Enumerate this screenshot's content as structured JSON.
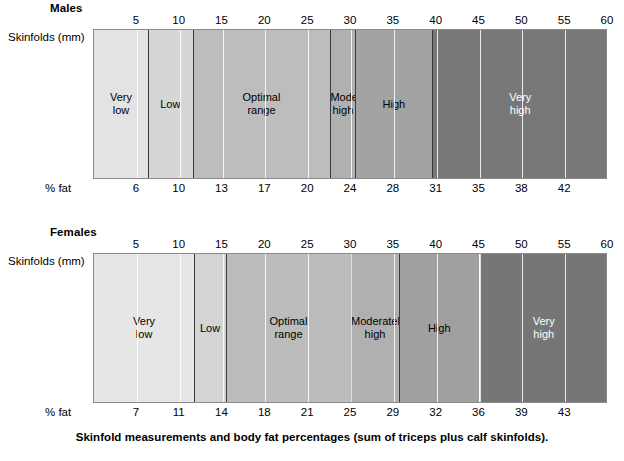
{
  "caption": "Skinfold measurements and body fat percentages (sum of triceps plus calf skinfolds).",
  "axis_labels": {
    "skinfolds": "Skinfolds (mm)",
    "pct_fat": "% fat"
  },
  "chart_data": {
    "type": "bar",
    "title": "Skinfold measurements and body fat percentages (sum of triceps plus calf skinfolds).",
    "xlabel": "Skinfolds (mm)",
    "ylabel": "% fat",
    "xlim": [
      0,
      60
    ],
    "grid": true,
    "legend": "none",
    "charts": [
      {
        "name": "Males",
        "top_axis_ticks": [
          5,
          10,
          15,
          20,
          25,
          30,
          35,
          40,
          45,
          50,
          55,
          60
        ],
        "bottom_axis_ticks": [
          6,
          10,
          13,
          17,
          20,
          24,
          28,
          31,
          35,
          38,
          42
        ],
        "bottom_tick_positions_mm": [
          5,
          10,
          15,
          20,
          25,
          30,
          35,
          40,
          45,
          50,
          55
        ],
        "bands": [
          {
            "label": "Very\nlow",
            "start_mm": 0,
            "end_mm": 6.3,
            "color": "#e3e3e3",
            "text_color": "#000000"
          },
          {
            "label": "Low",
            "start_mm": 6.3,
            "end_mm": 11.5,
            "color": "#d6d6d6",
            "text_color": "#000000"
          },
          {
            "label": "Optimal\nrange",
            "start_mm": 11.5,
            "end_mm": 27.6,
            "color": "#bdbdbd",
            "text_color": "#000000"
          },
          {
            "label": "Moderately\nhigh",
            "start_mm": 27.6,
            "end_mm": 30.5,
            "color": "#b0b0b0",
            "text_color": "#000000"
          },
          {
            "label": "High",
            "start_mm": 30.5,
            "end_mm": 39.5,
            "color": "#a3a3a3",
            "text_color": "#000000"
          },
          {
            "label": "Very\nhigh",
            "start_mm": 39.5,
            "end_mm": 60,
            "color": "#787878",
            "text_color": "#ffffff"
          }
        ]
      },
      {
        "name": "Females",
        "top_axis_ticks": [
          5,
          10,
          15,
          20,
          25,
          30,
          35,
          40,
          45,
          50,
          55,
          60
        ],
        "bottom_axis_ticks": [
          7,
          11,
          14,
          18,
          21,
          25,
          29,
          32,
          36,
          39,
          43
        ],
        "bottom_tick_positions_mm": [
          5,
          10,
          15,
          20,
          25,
          30,
          35,
          40,
          45,
          50,
          55
        ],
        "bands": [
          {
            "label": "Very\nlow",
            "start_mm": 0,
            "end_mm": 11.7,
            "color": "#e6e6e6",
            "text_color": "#000000"
          },
          {
            "label": "Low",
            "start_mm": 11.7,
            "end_mm": 15.4,
            "color": "#d4d4d4",
            "text_color": "#000000"
          },
          {
            "label": "Optimal\nrange",
            "start_mm": 15.4,
            "end_mm": 30.0,
            "color": "#bcbcbc",
            "text_color": "#000000"
          },
          {
            "label": "Moderately\nhigh",
            "start_mm": 30.0,
            "end_mm": 35.6,
            "color": "#b0b0b0",
            "text_color": "#000000"
          },
          {
            "label": "High",
            "start_mm": 35.6,
            "end_mm": 45.0,
            "color": "#a0a0a0",
            "text_color": "#000000"
          },
          {
            "label": "Very\nhigh",
            "start_mm": 45.0,
            "end_mm": 60,
            "color": "#767676",
            "text_color": "#ffffff"
          }
        ]
      }
    ]
  }
}
